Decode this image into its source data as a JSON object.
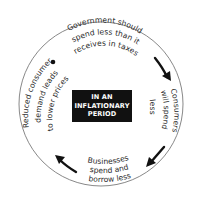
{
  "diagram": {
    "type": "cycle",
    "center_label": {
      "line1": "IN AN",
      "line2": "INFLATIONARY",
      "line3": "PERIOD"
    },
    "stages": [
      {
        "id": "government",
        "lines": [
          "Government should",
          "spend less than it",
          "receives in taxes"
        ],
        "position": "top"
      },
      {
        "id": "consumers",
        "lines": [
          "Consumers",
          "will spend",
          "less"
        ],
        "position": "right"
      },
      {
        "id": "businesses",
        "lines": [
          "Businesses",
          "spend and",
          "borrow less"
        ],
        "position": "bottom"
      },
      {
        "id": "reduced-demand",
        "lines": [
          "Reduced consumer",
          "demand leads",
          "to lower prices"
        ],
        "position": "left"
      }
    ],
    "arrows": [
      {
        "from": "government",
        "to": "consumers",
        "direction": "clockwise"
      },
      {
        "from": "consumers",
        "to": "businesses",
        "direction": "clockwise"
      },
      {
        "from": "businesses",
        "to": "reduced-demand",
        "direction": "clockwise"
      }
    ],
    "start_marker": "dot",
    "colors": {
      "ring": "#6a6a6a",
      "text": "#2a2a2a",
      "arrow": "#111111",
      "center_bg": "#111111",
      "center_text": "#ffffff"
    }
  }
}
